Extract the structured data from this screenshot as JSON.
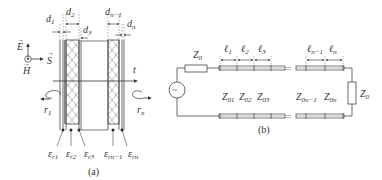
{
  "figure_a": {
    "caption": "(a)",
    "field_labels": {
      "E": "E",
      "H": "H",
      "S": "S"
    },
    "axis_label": "t",
    "rotation_labels": {
      "left": {
        "base": "r",
        "sub": "1"
      },
      "right": {
        "base": "r",
        "sub": "n"
      }
    },
    "thickness_labels": [
      {
        "base": "d",
        "sub": "1"
      },
      {
        "base": "d",
        "sub": "2"
      },
      {
        "base": "d",
        "sub": "3"
      },
      {
        "base": "d",
        "sub": "n−1"
      },
      {
        "base": "d",
        "sub": "n"
      }
    ],
    "permittivity_labels": [
      {
        "base": "ε",
        "sub": "r1"
      },
      {
        "base": "ε",
        "sub": "r2"
      },
      {
        "base": "ε",
        "sub": "r3"
      },
      {
        "base": "ε",
        "sub": "rn−1"
      },
      {
        "base": "ε",
        "sub": "rn"
      }
    ]
  },
  "figure_b": {
    "caption": "(b)",
    "source_impedance": {
      "base": "Z",
      "sub": "0"
    },
    "load_impedance": {
      "base": "Z",
      "sub": "0"
    },
    "source_symbol": "~",
    "length_labels": [
      {
        "base": "ℓ",
        "sub": "1"
      },
      {
        "base": "ℓ",
        "sub": "2"
      },
      {
        "base": "ℓ",
        "sub": "3"
      },
      {
        "base": "ℓ",
        "sub": "n−1"
      },
      {
        "base": "ℓ",
        "sub": "n"
      }
    ],
    "section_impedances": [
      {
        "base": "Z",
        "sub": "01"
      },
      {
        "base": "Z",
        "sub": "02"
      },
      {
        "base": "Z",
        "sub": "03"
      },
      {
        "base": "Z",
        "sub": "0n−1"
      },
      {
        "base": "Z",
        "sub": "0n"
      }
    ]
  },
  "colors": {
    "line": "#444444",
    "text": "#333333",
    "background": "#ffffff"
  }
}
